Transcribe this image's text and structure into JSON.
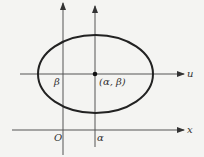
{
  "diagram": {
    "axes": {
      "x_label": "x",
      "u_label": "u",
      "origin_label": "O",
      "alpha_label": "α",
      "beta_label": "β"
    },
    "center_label": "(α, β)",
    "colors": {
      "stroke": "#222222",
      "background": "#f4f4f2"
    }
  }
}
